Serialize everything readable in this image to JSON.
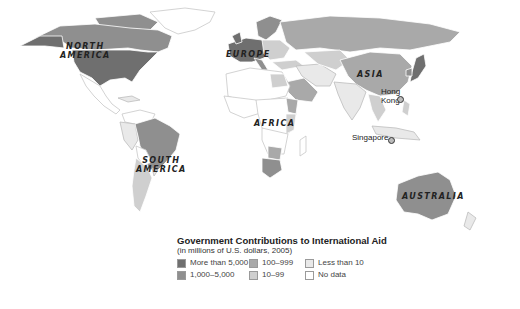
{
  "map": {
    "title": "Government Contributions to International Aid",
    "subtitle": "(in millions of U.S. dollars, 2005)",
    "region_labels": [
      {
        "id": "north-america",
        "text": "NORTH AMERICA",
        "line1": "NORTH",
        "line2": "AMERICA"
      },
      {
        "id": "europe",
        "text": "EUROPE"
      },
      {
        "id": "asia",
        "text": "ASIA"
      },
      {
        "id": "africa",
        "text": "AFRICA"
      },
      {
        "id": "south-america",
        "text": "SOUTH AMERICA",
        "line1": "SOUTH",
        "line2": "AMERICA"
      },
      {
        "id": "australia",
        "text": "AUSTRALIA"
      }
    ],
    "city_labels": [
      {
        "id": "hong-kong",
        "text": "Hong Kong",
        "line1": "Hong",
        "line2": "Kong"
      },
      {
        "id": "singapore",
        "text": "Singapore"
      }
    ]
  },
  "legend": {
    "items": [
      {
        "label": "More than 5,000",
        "color": "#6f6f6f"
      },
      {
        "label": "1,000–5,000",
        "color": "#8f8f8f"
      },
      {
        "label": "100–999",
        "color": "#a9a9a9"
      },
      {
        "label": "10–99",
        "color": "#cfcfcf"
      },
      {
        "label": "Less than 10",
        "color": "#e9e9e9"
      },
      {
        "label": "No data",
        "color": "#ffffff"
      }
    ]
  }
}
